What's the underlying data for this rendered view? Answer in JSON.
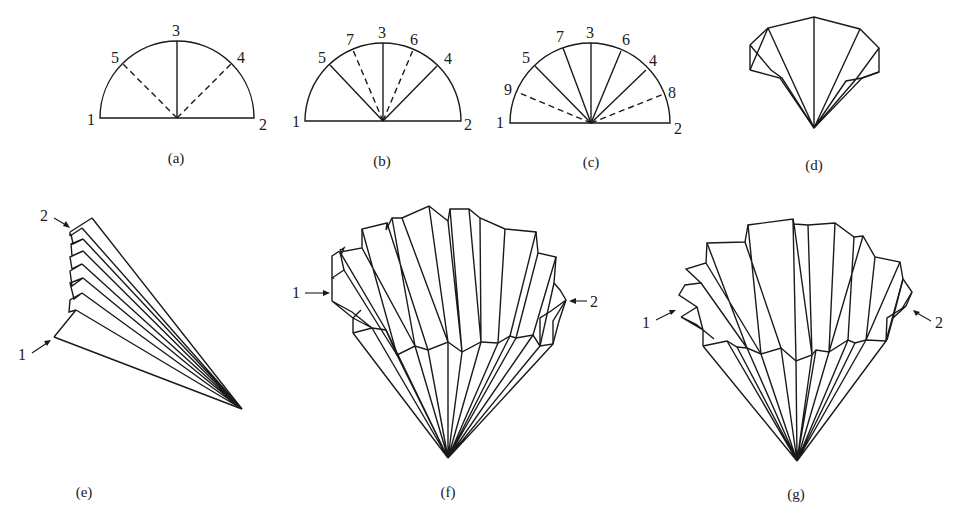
{
  "figure": {
    "panels": [
      {
        "id": "a",
        "caption": "(a)",
        "point_labels": [
          "1",
          "2",
          "3",
          "4",
          "5"
        ],
        "solid_folds": [
          "3"
        ],
        "dashed_folds": [
          "4",
          "5"
        ]
      },
      {
        "id": "b",
        "caption": "(b)",
        "point_labels": [
          "1",
          "2",
          "3",
          "4",
          "5",
          "6",
          "7"
        ],
        "solid_folds": [
          "3",
          "4",
          "5"
        ],
        "dashed_folds": [
          "6",
          "7"
        ]
      },
      {
        "id": "c",
        "caption": "(c)",
        "point_labels": [
          "1",
          "2",
          "3",
          "4",
          "5",
          "6",
          "7",
          "8",
          "9"
        ],
        "solid_folds": [
          "3",
          "4",
          "5",
          "6",
          "7"
        ],
        "dashed_folds": [
          "8",
          "9"
        ]
      },
      {
        "id": "d",
        "caption": "(d)",
        "point_labels": []
      },
      {
        "id": "e",
        "caption": "(e)",
        "point_labels": [
          "1",
          "2"
        ]
      },
      {
        "id": "f",
        "caption": "(f)",
        "point_labels": [
          "1",
          "2"
        ]
      },
      {
        "id": "g",
        "caption": "(g)",
        "point_labels": [
          "1",
          "2"
        ]
      }
    ]
  }
}
